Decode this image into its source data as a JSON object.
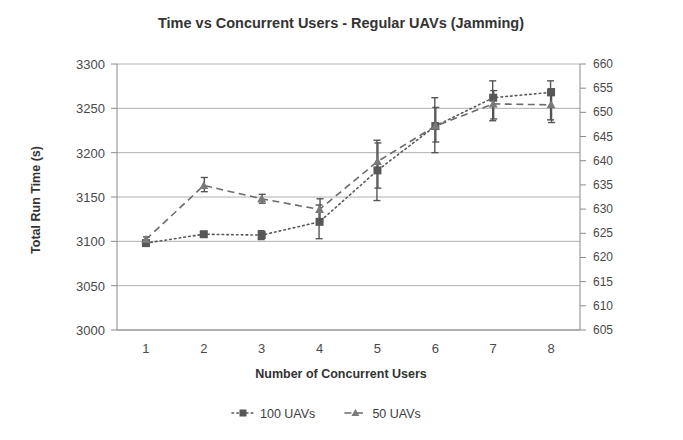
{
  "chart_data": {
    "type": "line",
    "title": "Time vs Concurrent Users - Regular UAVs (Jamming)",
    "xlabel": "Number of Concurrent Users",
    "ylabel": "Total Run Time (s)",
    "y2label": "",
    "categories": [
      "1",
      "2",
      "3",
      "4",
      "5",
      "6",
      "7",
      "8"
    ],
    "x": [
      1,
      2,
      3,
      4,
      5,
      6,
      7,
      8
    ],
    "ylim": [
      3000,
      3300
    ],
    "yticks": [
      3000,
      3050,
      3100,
      3150,
      3200,
      3250,
      3300
    ],
    "y2lim": [
      605,
      660
    ],
    "y2ticks": [
      605,
      610,
      615,
      620,
      625,
      630,
      635,
      640,
      645,
      650,
      655,
      660
    ],
    "grid": true,
    "legend_position": "bottom",
    "series": [
      {
        "name": "100 UAVs",
        "axis": "left",
        "marker": "square",
        "line_style": "dotted",
        "color": "#575757",
        "values": [
          3098,
          3108,
          3107,
          3122,
          3180,
          3230,
          3262,
          3268
        ],
        "err_low": [
          3096,
          3105,
          3102,
          3103,
          3146,
          3200,
          3236,
          3237
        ],
        "err_high": [
          3101,
          3111,
          3112,
          3141,
          3214,
          3262,
          3281,
          3281
        ]
      },
      {
        "name": "50 UAVs",
        "axis": "right",
        "marker": "triangle",
        "line_style": "dashed",
        "color": "#7a7a7a",
        "values": [
          3102,
          3163,
          3148,
          3136,
          3190,
          3230,
          3255,
          3254
        ],
        "err_low": [
          3099,
          3156,
          3143,
          3125,
          3160,
          3212,
          3238,
          3234
        ],
        "err_high": [
          3105,
          3172,
          3153,
          3148,
          3211,
          3251,
          3270,
          3272
        ]
      }
    ],
    "legend": [
      {
        "label": "100 UAVs",
        "marker": "square",
        "line_style": "dotted"
      },
      {
        "label": "50 UAVs",
        "marker": "triangle",
        "line_style": "dashed"
      }
    ],
    "colors": {
      "series_100": "#575757",
      "series_50": "#7a7a7a",
      "grid": "#b0b0b0",
      "axis": "#8a8a8a",
      "text": "#3d3d3d",
      "background": "#ffffff"
    }
  }
}
